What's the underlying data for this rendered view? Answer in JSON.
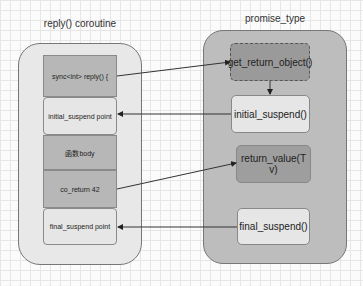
{
  "left": {
    "title": "reply() coroutine",
    "boxes": [
      {
        "label": "sync<int> reply() {"
      },
      {
        "label": "initial_suspend point"
      },
      {
        "label": "函数body"
      },
      {
        "label": "co_return 42"
      },
      {
        "label": "final_suspend point"
      }
    ]
  },
  "right": {
    "title": "promise_type",
    "boxes": [
      {
        "label": "get_return_object()"
      },
      {
        "label": "initial_suspend()"
      },
      {
        "label": "return_value(T v)"
      },
      {
        "label": "final_suspend()"
      }
    ]
  },
  "colors": {
    "left_container": "#e8e8e8",
    "right_container": "#bdbdbd",
    "dark_box": "#b7b7b7",
    "light_box": "#e6e6e6",
    "selected_box": "#9a9a9a"
  }
}
